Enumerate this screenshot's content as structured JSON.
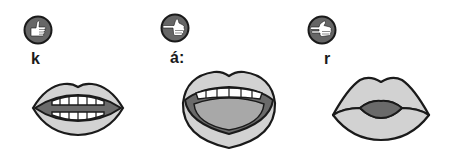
{
  "colors": {
    "outline": "#1a1a1a",
    "badge_fill": "#666666",
    "lip_fill": "#d2d2d2",
    "inner_dark": "#6a6a6a",
    "tongue": "#a8a8a8",
    "teeth": "#ffffff",
    "background": "#ffffff"
  },
  "items": [
    {
      "phoneme": "k",
      "hand_icon": "thumb-up-hand-icon",
      "mouth_icon": "mouth-slightly-open-teeth-icon"
    },
    {
      "phoneme": "á:",
      "hand_icon": "pointing-hand-icon",
      "mouth_icon": "mouth-wide-open-icon"
    },
    {
      "phoneme": "r",
      "hand_icon": "two-finger-hand-icon",
      "mouth_icon": "mouth-closed-lips-icon"
    }
  ]
}
